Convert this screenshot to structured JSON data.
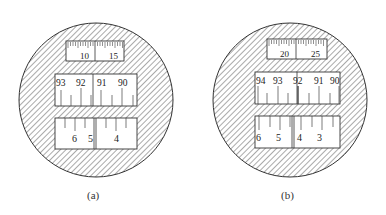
{
  "figure": {
    "panels": [
      {
        "id": "a",
        "caption": "(a)",
        "top_scale": {
          "labels": [
            "10",
            "15"
          ]
        },
        "middle_scale": {
          "labels": [
            "93",
            "92",
            "91",
            "90"
          ]
        },
        "bottom_scale": {
          "labels": [
            "6",
            "5",
            "4"
          ]
        }
      },
      {
        "id": "b",
        "caption": "(b)",
        "top_scale": {
          "labels": [
            "20",
            "25"
          ]
        },
        "middle_scale": {
          "labels": [
            "94",
            "93",
            "92",
            "91",
            "90"
          ]
        },
        "bottom_scale": {
          "labels": [
            "6",
            "5",
            "4",
            "3"
          ]
        }
      }
    ]
  }
}
